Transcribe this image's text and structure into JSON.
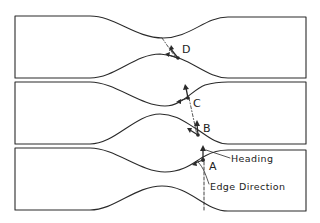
{
  "diagram": {
    "colors": {
      "ink": "#2a2a2a",
      "background": "#ffffff"
    },
    "panels": [
      {
        "id": "panel-top",
        "y_top": 16,
        "y_bottom": 78
      },
      {
        "id": "panel-middle",
        "y_top": 82,
        "y_bottom": 144
      },
      {
        "id": "panel-bottom",
        "y_top": 148,
        "y_bottom": 210
      }
    ],
    "points": [
      {
        "label": "D",
        "panel": "panel-top"
      },
      {
        "label": "C",
        "panel": "panel-middle"
      },
      {
        "label": "B",
        "panel": "panel-middle"
      },
      {
        "label": "A",
        "panel": "panel-bottom"
      }
    ],
    "annotations": {
      "heading": "Heading",
      "edge_direction": "Edge Direction"
    }
  }
}
